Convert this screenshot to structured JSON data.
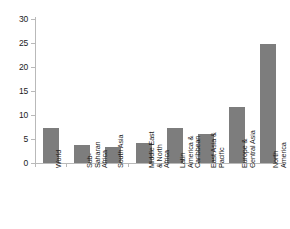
{
  "chart_data": {
    "type": "bar",
    "title": "",
    "subtitle": "",
    "xlabel": "",
    "ylabel": "",
    "ylim": [
      0,
      30
    ],
    "xlim": null,
    "grid": false,
    "legend": null,
    "legend_position": "none",
    "bar_color": "#7d7d7d",
    "axis_color": "#b9b9b9",
    "text_color": "#1c1c1c",
    "background": "#ffffff",
    "y_ticks": [
      0,
      5,
      10,
      15,
      20,
      25,
      30
    ],
    "y_tick_labels": [
      "0",
      "5",
      "10",
      "15",
      "20",
      "25",
      "30"
    ],
    "categories": [
      "World",
      "Sub-\nSaharan\nAfrica",
      "South Asia",
      "Middle East\n& North\nAfrica",
      "Latin\nAmerica &\nCaribbean",
      "East Asia &\nPacific",
      "Europe &\nCentral Asia",
      "North\nAmerica"
    ],
    "values": [
      7.3,
      3.8,
      3.4,
      4.1,
      7.3,
      6.0,
      11.7,
      24.8
    ],
    "series": [
      {
        "name": "",
        "values": [
          7.3,
          3.8,
          3.4,
          4.1,
          7.3,
          6.0,
          11.7,
          24.8
        ]
      }
    ],
    "annotations": []
  }
}
